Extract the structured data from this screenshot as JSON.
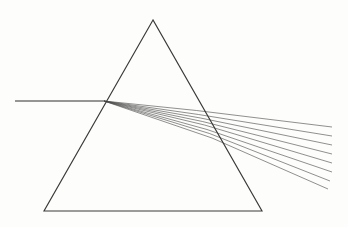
{
  "figure": {
    "background_color": "#fdfdfb",
    "width": 348,
    "height": 227
  },
  "prism": {
    "name": "triangular-prism",
    "stroke_color": "#3a3a3a",
    "stroke_width": 1.15,
    "fill": "none",
    "vertices": {
      "apex": {
        "x": 153,
        "y": 20
      },
      "bottom_left": {
        "x": 44,
        "y": 211
      },
      "bottom_right": {
        "x": 262,
        "y": 211
      }
    },
    "points_attr": "153,20 44,211 262,211"
  },
  "incident_ray": {
    "name": "incident-ray",
    "label": "incident white light",
    "stroke_color": "#2e2e2e",
    "stroke_width": 1.15,
    "start": {
      "x": 15,
      "y": 101
    },
    "end": {
      "x": 104,
      "y": 101
    },
    "d_attr": "M 15 101 L 104 101"
  },
  "entry_point": {
    "x": 104,
    "y": 101
  },
  "rays": {
    "count": 8,
    "stroke_color": "#4a4a4a",
    "stroke_width": 0.62,
    "internal_label": "refracted ray inside prism",
    "emergent_label": "emergent dispersed ray",
    "spectrum": [
      {
        "index": 0,
        "name": "ray-1",
        "internal_d": "M 104 101 L 196.5 110.5",
        "emergent_d": "M 196.5 110.5 L 332 127"
      },
      {
        "index": 1,
        "name": "ray-2",
        "internal_d": "M 104 101 L 198.5 114.5",
        "emergent_d": "M 198.5 114.5 L 332 136"
      },
      {
        "index": 2,
        "name": "ray-3",
        "internal_d": "M 104 101 L 200.5 118.0",
        "emergent_d": "M 200.5 118.0 L 332 145"
      },
      {
        "index": 3,
        "name": "ray-4",
        "internal_d": "M 104 101 L 202.5 121.5",
        "emergent_d": "M 202.5 121.5 L 332 154"
      },
      {
        "index": 4,
        "name": "ray-5",
        "internal_d": "M 104 101 L 204.5 125.0",
        "emergent_d": "M 204.5 125.0 L 332 163"
      },
      {
        "index": 5,
        "name": "ray-6",
        "internal_d": "M 104 101 L 207.0 129.5",
        "emergent_d": "M 207.0 129.5 L 332 172"
      },
      {
        "index": 6,
        "name": "ray-7",
        "internal_d": "M 104 101 L 209.5 133.5",
        "emergent_d": "M 209.5 133.5 L 330 181"
      },
      {
        "index": 7,
        "name": "ray-8",
        "internal_d": "M 104 101 L 212.0 138.0",
        "emergent_d": "M 212.0 138.0 L 328 189"
      }
    ]
  }
}
